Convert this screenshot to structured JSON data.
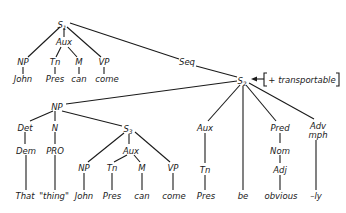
{
  "diagram": {
    "type": "syntax-tree",
    "nodes": [
      {
        "id": "S1",
        "label": "S",
        "sub": "1",
        "x": 64,
        "y": 25
      },
      {
        "id": "S1_NP",
        "label": "NP",
        "x": 23,
        "y": 65
      },
      {
        "id": "S1_Aux",
        "label": "Aux",
        "x": 64,
        "y": 45
      },
      {
        "id": "S1_Tn",
        "label": "Tn",
        "x": 55,
        "y": 65
      },
      {
        "id": "S1_M",
        "label": "M",
        "x": 79,
        "y": 65
      },
      {
        "id": "S1_VP",
        "label": "VP",
        "x": 104,
        "y": 65
      },
      {
        "id": "S1_John",
        "label": "John",
        "x": 23,
        "y": 82
      },
      {
        "id": "S1_Pres",
        "label": "Pres",
        "x": 55,
        "y": 82
      },
      {
        "id": "S1_can",
        "label": "can",
        "x": 79,
        "y": 82
      },
      {
        "id": "S1_come",
        "label": "come",
        "x": 107,
        "y": 82
      },
      {
        "id": "Seq",
        "label": "Seq",
        "x": 186,
        "y": 64
      },
      {
        "id": "S2",
        "label": "S",
        "sub": "2",
        "x": 243,
        "y": 82
      },
      {
        "id": "feature",
        "label": "+ transportable",
        "x": 300,
        "y": 82
      },
      {
        "id": "NP",
        "label": "NP",
        "x": 57,
        "y": 108
      },
      {
        "id": "Det",
        "label": "Det",
        "x": 25,
        "y": 129
      },
      {
        "id": "N",
        "label": "N",
        "x": 54,
        "y": 129
      },
      {
        "id": "Dem",
        "label": "Dem",
        "x": 26,
        "y": 152
      },
      {
        "id": "PRO",
        "label": "PRO",
        "x": 55,
        "y": 152
      },
      {
        "id": "That",
        "label": "That",
        "x": 25,
        "y": 198
      },
      {
        "id": "thing",
        "label": "\"thing\"",
        "x": 53,
        "y": 198
      },
      {
        "id": "S3",
        "label": "S",
        "sub": "3",
        "x": 129,
        "y": 130
      },
      {
        "id": "S3_Aux",
        "label": "Aux",
        "x": 131,
        "y": 152
      },
      {
        "id": "S3_NP",
        "label": "NP",
        "x": 84,
        "y": 170
      },
      {
        "id": "S3_Tn",
        "label": "Tn",
        "x": 112,
        "y": 170
      },
      {
        "id": "S3_M",
        "label": "M",
        "x": 142,
        "y": 170
      },
      {
        "id": "S3_VP",
        "label": "VP",
        "x": 173,
        "y": 170
      },
      {
        "id": "S3_John",
        "label": "John",
        "x": 84,
        "y": 198
      },
      {
        "id": "S3_Pres",
        "label": "Pres",
        "x": 112,
        "y": 198
      },
      {
        "id": "S3_can",
        "label": "can",
        "x": 142,
        "y": 198
      },
      {
        "id": "S3_come",
        "label": "come",
        "x": 174,
        "y": 198
      },
      {
        "id": "S2_Aux",
        "label": "Aux",
        "x": 205,
        "y": 130
      },
      {
        "id": "S2_Tn",
        "label": "Tn",
        "x": 205,
        "y": 172
      },
      {
        "id": "S2_Pres",
        "label": "Pres",
        "x": 206,
        "y": 198
      },
      {
        "id": "be",
        "label": "be",
        "x": 243,
        "y": 198
      },
      {
        "id": "Pred",
        "label": "Pred",
        "x": 280,
        "y": 130
      },
      {
        "id": "Nom",
        "label": "Nom",
        "x": 280,
        "y": 152
      },
      {
        "id": "Adj",
        "label": "Adj",
        "x": 280,
        "y": 172
      },
      {
        "id": "obvious",
        "label": "obvious",
        "x": 281,
        "y": 198
      },
      {
        "id": "Adv",
        "label": "Adv",
        "x": 318,
        "y": 128
      },
      {
        "id": "mph",
        "label": "mph",
        "x": 318,
        "y": 137
      },
      {
        "id": "ly",
        "label": "–ly",
        "x": 316,
        "y": 198
      }
    ]
  }
}
